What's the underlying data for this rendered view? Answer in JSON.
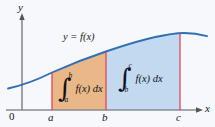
{
  "figure": {
    "name": "definite-integral-additivity-diagram",
    "background_color": "#f7f8fb"
  },
  "axes": {
    "x_label": "x",
    "y_label": "y",
    "origin_label": "0",
    "axis_color": "#8a8a92",
    "x_ticks": [
      "a",
      "b",
      "c"
    ]
  },
  "curve": {
    "label": "y = f(x)",
    "color": "#2f6fb5"
  },
  "regions": [
    {
      "name": "region-a-to-b",
      "fill": "#eab888",
      "integral_symbol": "∫",
      "upper_limit": "b",
      "lower_limit": "a",
      "integrand": "f(x) dx"
    },
    {
      "name": "region-b-to-c",
      "fill": "#c3d9f0",
      "integral_symbol": "∫",
      "upper_limit": "c",
      "lower_limit": "b",
      "integrand": "f(x) dx"
    }
  ],
  "boundary_lines": {
    "color": "#e03a4e"
  }
}
